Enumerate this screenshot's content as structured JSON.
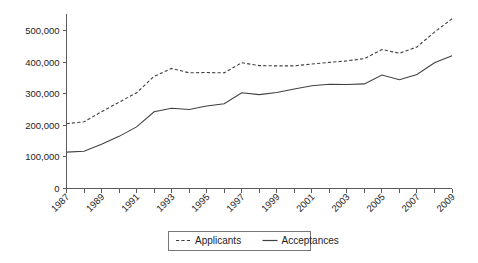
{
  "chart_data": {
    "type": "line",
    "title": "",
    "xlabel": "",
    "ylabel": "",
    "grid": false,
    "legend_position": "bottom",
    "x": [
      1987,
      1988,
      1989,
      1990,
      1991,
      1992,
      1993,
      1994,
      1995,
      1996,
      1997,
      1998,
      1999,
      2000,
      2001,
      2002,
      2003,
      2004,
      2005,
      2006,
      2007,
      2008,
      2009
    ],
    "xlim": [
      1987,
      2009
    ],
    "ylim": [
      0,
      560000
    ],
    "xtick_labels": [
      "1987",
      "1989",
      "1991",
      "1993",
      "1995",
      "1997",
      "1999",
      "2001",
      "2003",
      "2005",
      "2007",
      "2009"
    ],
    "xtick_values": [
      1987,
      1989,
      1991,
      1993,
      1995,
      1997,
      1999,
      2001,
      2003,
      2005,
      2007,
      2009
    ],
    "ytick_labels": [
      "0",
      "100,000",
      "200,000",
      "300,000",
      "400,000",
      "500,000"
    ],
    "ytick_values": [
      0,
      100000,
      200000,
      300000,
      400000,
      500000
    ],
    "series": [
      {
        "name": "Applicants",
        "style": "dashed",
        "color": "#404040",
        "values": [
          205000,
          211000,
          243000,
          273000,
          303000,
          355000,
          380000,
          366000,
          367000,
          366000,
          398000,
          389000,
          388000,
          388000,
          394000,
          399000,
          404000,
          411000,
          440000,
          428000,
          448000,
          495000,
          537000
        ]
      },
      {
        "name": "Acceptances",
        "style": "solid",
        "color": "#404040",
        "values": [
          115000,
          118000,
          140000,
          165000,
          195000,
          243000,
          254000,
          250000,
          261000,
          268000,
          303000,
          297000,
          304000,
          315000,
          325000,
          330000,
          329000,
          331000,
          359000,
          344000,
          361000,
          398000,
          420000
        ]
      }
    ]
  },
  "legend": {
    "items": [
      {
        "label": "Applicants",
        "style": "dashed"
      },
      {
        "label": "Acceptances",
        "style": "solid"
      }
    ]
  }
}
